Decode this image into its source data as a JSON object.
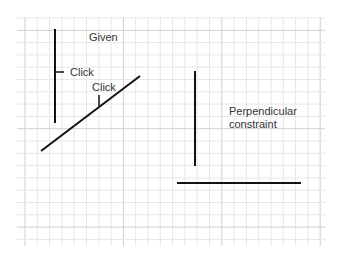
{
  "diagram": {
    "title": "Perpendicular constraint",
    "labels": {
      "given": "Given",
      "click1": "Click",
      "click2": "Click",
      "result_line1": "Perpendicular",
      "result_line2": "constraint"
    },
    "colors": {
      "grid_minor": "#e6e6e6",
      "grid_major": "#cfcfcf",
      "stroke": "#111111",
      "text": "#333333"
    }
  }
}
